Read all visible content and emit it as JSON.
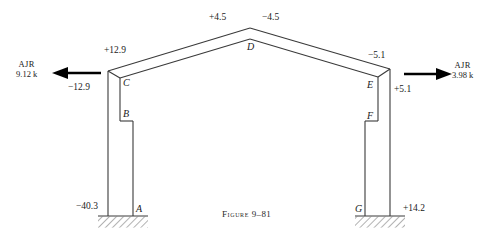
{
  "figure": {
    "caption_label": "Figure",
    "caption_number": "9–81",
    "caption_full": "Figure 9–81"
  },
  "joints": {
    "a": "A",
    "b": "B",
    "c": "C",
    "d": "D",
    "e": "E",
    "f": "F",
    "g": "G"
  },
  "moments": {
    "left_rafter_near_knee": "+12.9",
    "left_column_top": "−12.9",
    "apex_left": "+4.5",
    "apex_right": "−4.5",
    "right_rafter_near_knee": "−5.1",
    "right_column_top": "+5.1",
    "left_base": "−40.3",
    "right_base": "+14.2"
  },
  "reactions": {
    "left": {
      "name": "AJR",
      "magnitude": "9.12 k",
      "direction": "left"
    },
    "right": {
      "name": "AJR",
      "magnitude": "3.98 k",
      "direction": "right"
    }
  },
  "icons": {
    "left_arrow": "left-arrow-icon",
    "right_arrow": "right-arrow-icon",
    "left_support": "fixed-support-hatch-icon",
    "right_support": "fixed-support-hatch-icon"
  },
  "colors": {
    "line": "#3a3a3a",
    "text": "#1a1a1a",
    "arrow": "#000000",
    "background": "#ffffff"
  }
}
